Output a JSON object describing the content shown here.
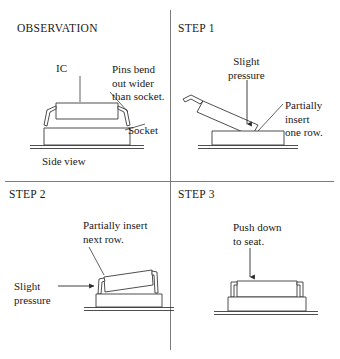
{
  "figure": {
    "kind": "four-panel-instruction-diagram",
    "line_color": "#3b3b3b",
    "text_color": "#1a1a1a",
    "background": "#ffffff"
  },
  "panels": {
    "observation": {
      "title": "OBSERVATION",
      "labels": {
        "ic": "IC",
        "pins_bend": "Pins bend\nout wider\nthan socket.",
        "socket": "Socket",
        "side_view": "Side view"
      }
    },
    "step1": {
      "title": "STEP 1",
      "labels": {
        "slight_pressure": "Slight\npressure",
        "partially_insert": "Partially\ninsert\none row."
      }
    },
    "step2": {
      "title": "STEP 2",
      "labels": {
        "partially_insert_next": "Partially insert\nnext row.",
        "slight_pressure": "Slight\npressure"
      }
    },
    "step3": {
      "title": "STEP 3",
      "labels": {
        "push_down": "Push down\nto seat."
      }
    }
  },
  "icons": {
    "arrow_down": "arrow-down-icon",
    "arrow_right": "arrow-right-icon",
    "leader_line": "leader-line"
  }
}
